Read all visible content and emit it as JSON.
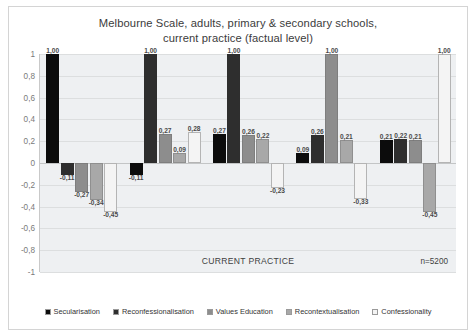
{
  "title": {
    "line1": "Melbourne Scale, adults, primary & secondary schools,",
    "line2": "current practice (factual level)"
  },
  "footer": {
    "practice": "CURRENT PRACTICE",
    "n": "n=5200"
  },
  "chart_data": {
    "type": "bar",
    "title": "Melbourne Scale, adults, primary & secondary schools, current practice (factual level)",
    "xlabel": "CURRENT PRACTICE",
    "ylabel": "",
    "ylim": [
      -1,
      1
    ],
    "yticks": [
      "1",
      "0,8",
      "0,6",
      "0,4",
      "0,2",
      "0",
      "-0,2",
      "-0,4",
      "-0,6",
      "-0,8",
      "-1"
    ],
    "grid": true,
    "legend_position": "bottom",
    "annotation": "n=5200",
    "categories": [
      "Secularisation",
      "Reconfessionalisation",
      "Values Education",
      "Recontextualisation",
      "Confessionality"
    ],
    "series": [
      {
        "name": "Secularisation",
        "color": "#0c0c0c",
        "values": [
          1.0,
          -0.11,
          0.27,
          0.09,
          0.21
        ],
        "labels": [
          "1,00",
          "-0,11",
          "0,27",
          "0,09",
          "0,21"
        ]
      },
      {
        "name": "Reconfessionalisation",
        "color": "#2e2e2e",
        "values": [
          -0.11,
          1.0,
          1.0,
          0.26,
          0.22
        ],
        "labels": [
          "-0,11",
          "1,00",
          "1,00",
          "0,26",
          "0,22"
        ]
      },
      {
        "name": "Values Education",
        "color": "#8d8d8d",
        "values": [
          -0.27,
          0.27,
          0.26,
          1.0,
          0.21
        ],
        "labels": [
          "-0,27",
          "0,27",
          "0,26",
          "1,00",
          "0,21"
        ]
      },
      {
        "name": "Recontextualisation",
        "color": "#a8a8a8",
        "values": [
          -0.34,
          0.09,
          -0.33,
          -0.45,
          1.0
        ],
        "labels": [
          "-0,34",
          "0,09",
          "-0,33",
          "-0,45",
          "1,00"
        ]
      },
      {
        "name": "Confessionality",
        "color": "#f4f4f4",
        "values": [
          -0.45,
          0.28,
          0.22,
          0.21,
          1.0
        ],
        "labels": [
          "-0,45",
          "0,28",
          "0,22",
          "0,21",
          "1,00"
        ]
      }
    ],
    "groups": [
      {
        "bars": [
          {
            "series": 0,
            "value": 1.0,
            "label": "1,00"
          },
          {
            "series": 1,
            "value": -0.11,
            "label": "-0,11"
          },
          {
            "series": 2,
            "value": -0.27,
            "label": "-0,27"
          },
          {
            "series": 3,
            "value": -0.34,
            "label": "-0,34"
          },
          {
            "series": 4,
            "value": -0.45,
            "label": "-0,45"
          }
        ]
      },
      {
        "bars": [
          {
            "series": 0,
            "value": -0.11,
            "label": "-0,11"
          },
          {
            "series": 1,
            "value": 1.0,
            "label": "1,00"
          },
          {
            "series": 2,
            "value": 0.27,
            "label": "0,27"
          },
          {
            "series": 3,
            "value": 0.09,
            "label": "0,09"
          },
          {
            "series": 4,
            "value": 0.28,
            "label": "0,28"
          }
        ]
      },
      {
        "bars": [
          {
            "series": 0,
            "value": 0.27,
            "label": "0,27"
          },
          {
            "series": 1,
            "value": 1.0,
            "label": "1,00"
          },
          {
            "series": 2,
            "value": 0.26,
            "label": "0,26"
          },
          {
            "series": 3,
            "value": 0.22,
            "label": "0,22"
          },
          {
            "series": 4,
            "value": -0.23,
            "label": "-0,23"
          }
        ]
      },
      {
        "bars": [
          {
            "series": 0,
            "value": 0.09,
            "label": "0,09"
          },
          {
            "series": 1,
            "value": 0.26,
            "label": "0,26"
          },
          {
            "series": 2,
            "value": 1.0,
            "label": "1,00"
          },
          {
            "series": 3,
            "value": 0.21,
            "label": "0,21"
          },
          {
            "series": 4,
            "value": -0.33,
            "label": "-0,33"
          }
        ]
      },
      {
        "bars": [
          {
            "series": 0,
            "value": 0.21,
            "label": "0,21"
          },
          {
            "series": 1,
            "value": 0.22,
            "label": "0,22"
          },
          {
            "series": 2,
            "value": 0.21,
            "label": "0,21"
          },
          {
            "series": 3,
            "value": -0.45,
            "label": "-0,45"
          },
          {
            "series": 4,
            "value": 1.0,
            "label": "1,00"
          }
        ]
      }
    ]
  }
}
